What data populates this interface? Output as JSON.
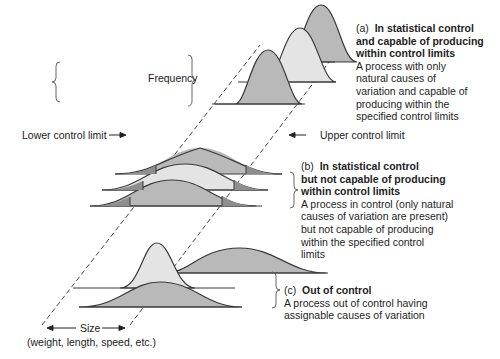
{
  "figure": {
    "type": "statistical process control distributions diagram",
    "colors": {
      "dark_fill": "#b9b9b9",
      "light_fill": "#e4e4e4",
      "tail_fill": "#8e8e8e",
      "outline": "#3a3a3a",
      "dashed_limit": "#444444"
    }
  },
  "labels": {
    "frequency": "Frequency",
    "lower_control_limit": "Lower control limit",
    "upper_control_limit": "Upper control limit",
    "size": "Size",
    "size_sub": "(weight, length, speed, etc.)"
  },
  "panels": [
    {
      "tag": "(a)",
      "title_lines": [
        "In statistical control",
        "and capable of producing",
        "within control limits"
      ],
      "desc_lines": [
        "A process with only",
        "natural causes of",
        "variation and capable of",
        "producing within the",
        "specified control limits"
      ]
    },
    {
      "tag": "(b)",
      "title_lines": [
        "In statistical control",
        "but not capable of producing",
        "within control limits"
      ],
      "desc_lines": [
        "A process in control (only natural",
        "causes of variation are present)",
        "but not capable of producing",
        "within the specified control",
        "limits"
      ]
    },
    {
      "tag": "(c)",
      "title_lines": [
        "Out of control"
      ],
      "desc_lines": [
        "A process out of control having",
        "assignable causes of variation"
      ]
    }
  ]
}
